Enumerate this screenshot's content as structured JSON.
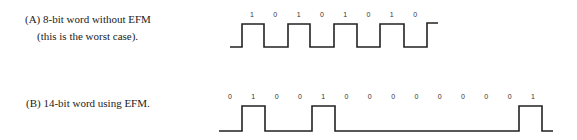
{
  "diagram_a": {
    "caption_line1": "(A) 8-bit word without EFM",
    "caption_line2": "(this is the worst case).",
    "bits": [
      "1",
      "0",
      "1",
      "0",
      "1",
      "0",
      "1",
      "0"
    ]
  },
  "diagram_b": {
    "caption": "(B) 14-bit word using EFM.",
    "bits": [
      "0",
      "1",
      "0",
      "0",
      "1",
      "0",
      "0",
      "0",
      "0",
      "0",
      "0",
      "0",
      "0",
      "1"
    ]
  },
  "colors": {
    "line": "#222222",
    "text": "#222222"
  }
}
